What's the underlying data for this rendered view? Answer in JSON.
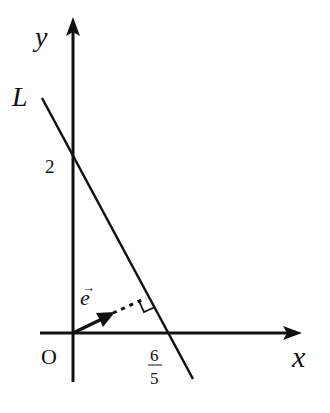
{
  "diagram": {
    "type": "coordinate-geometry",
    "axes": {
      "x_label": "x",
      "y_label": "y",
      "origin_label": "O"
    },
    "line": {
      "label": "L",
      "y_intercept_label": "2",
      "x_intercept": {
        "numerator": "6",
        "denominator": "5"
      }
    },
    "vector": {
      "label": "e",
      "arrow_symbol": "→",
      "description": "unit normal vector from origin perpendicular to L"
    },
    "right_angle_mark": true,
    "colors": {
      "stroke": "#111111",
      "background": "#ffffff"
    }
  }
}
